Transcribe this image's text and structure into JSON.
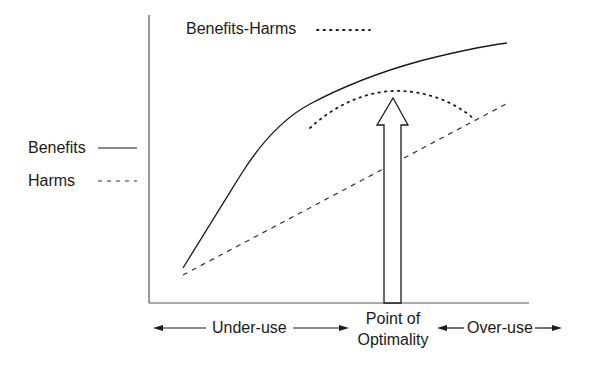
{
  "diagram": {
    "legend": {
      "benefits_harms_label": "Benefits-Harms",
      "benefits_label": "Benefits",
      "harms_label": "Harms"
    },
    "x_axis": {
      "under_use_label": "Under-use",
      "optimality_label_line1": "Point of",
      "optimality_label_line2": "Optimality",
      "over_use_label": "Over-use"
    },
    "series": [
      {
        "name": "Benefits",
        "style": "solid"
      },
      {
        "name": "Harms",
        "style": "dashed"
      },
      {
        "name": "Benefits-Harms",
        "style": "dotted"
      }
    ],
    "colors": {
      "line": "#1a1a1a",
      "axis": "#555555",
      "background": "#ffffff"
    }
  }
}
